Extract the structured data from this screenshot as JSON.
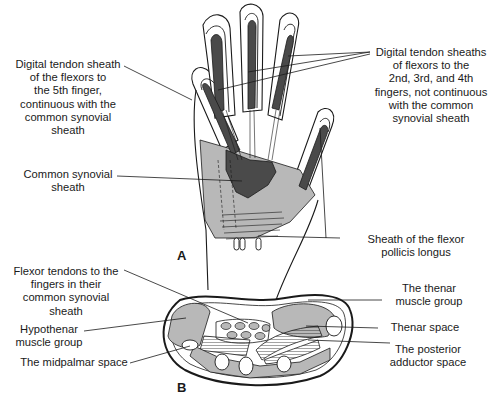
{
  "figure": {
    "panels": [
      {
        "id": "A",
        "label": "A",
        "title": "Palmar view of hand showing synovial sheaths"
      },
      {
        "id": "B",
        "label": "B",
        "title": "Cross-section of palm"
      }
    ]
  },
  "panel_a": {
    "labels": {
      "digital_5th": "Digital tendon sheath\nof the flexors to\nthe 5th finger,\ncontinuous with the\ncommon synovial\nsheath",
      "digital_2_4": "Digital tendon sheaths\nof flexors to the\n2nd, 3rd, and 4th\nfingers, not continuous\nwith the common\nsynovial sheath",
      "common_sheath": "Common synovial\nsheath",
      "fpl_sheath": "Sheath of the flexor\npollicis longus"
    }
  },
  "panel_b": {
    "labels": {
      "flexor_tendons": "Flexor tendons to the\nfingers in their\ncommon synovial\nsheath",
      "hypothenar": "Hypothenar\nmuscle group",
      "midpalmar": "The midpalmar space",
      "thenar_group": "The thenar\nmuscle group",
      "thenar_space": "Thenar space",
      "posterior_adductor": "The posterior\nadductor space"
    }
  },
  "colors": {
    "sheath_dark": "#4a4a4a",
    "muscle_gray": "#b8b8b8",
    "outline": "#1a1a1a",
    "background": "#ffffff"
  }
}
